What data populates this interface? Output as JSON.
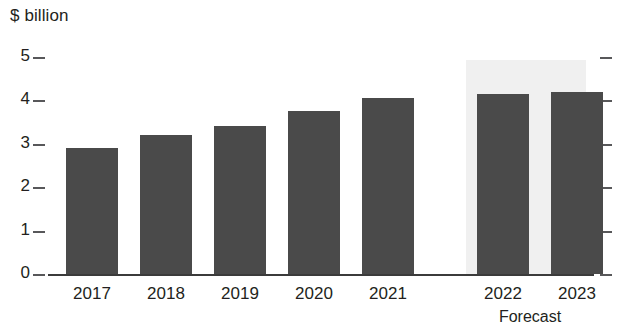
{
  "chart_data": {
    "type": "bar",
    "title": "",
    "subtitle": "",
    "xlabel": "",
    "ylabel": "$ billion",
    "categories": [
      "2017",
      "2018",
      "2019",
      "2020",
      "2021",
      "2022",
      "2023"
    ],
    "values": [
      2.9,
      3.2,
      3.4,
      3.75,
      4.05,
      4.15,
      4.2
    ],
    "series": [
      {
        "name": "Value",
        "values": [
          2.9,
          3.2,
          3.4,
          3.75,
          4.05,
          4.15,
          4.2
        ]
      }
    ],
    "ylim": [
      0,
      5
    ],
    "ytick_labels": [
      "0",
      "1",
      "2",
      "3",
      "4",
      "5"
    ],
    "ytick_values": [
      0,
      1,
      2,
      3,
      4,
      5
    ],
    "grid": false,
    "legend": false,
    "legend_position": "none",
    "annotations": [
      {
        "text": "Forecast",
        "applies_to": [
          "2022",
          "2023"
        ],
        "style": "shaded-band"
      }
    ],
    "forecast_start_category": "2022",
    "forecast_caption": "Forecast",
    "colors": {
      "bar": "#4a4a4a",
      "forecast_band": "#f0f0f0",
      "axis": "#3b3b3b",
      "tick": "#58585a",
      "text": "#231f20",
      "background": "#ffffff"
    }
  }
}
